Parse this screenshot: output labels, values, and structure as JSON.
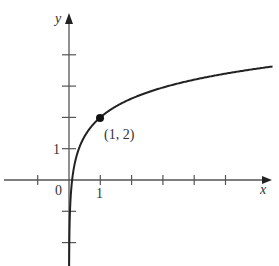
{
  "chart_data": {
    "type": "line",
    "function": "y = 2 + 2*log10(x)",
    "title": "",
    "xlabel": "x",
    "ylabel": "y",
    "x_tick_labels": [
      "0",
      "1"
    ],
    "y_tick_labels": [
      "1"
    ],
    "xlim": [
      -2.1,
      6.5
    ],
    "ylim": [
      -2.8,
      5.3
    ],
    "x_ticks": [
      -1,
      1,
      2,
      3,
      4,
      5
    ],
    "y_ticks": [
      -2,
      -1,
      1,
      2,
      3,
      4
    ],
    "grid": false,
    "highlighted_point": {
      "x": 1,
      "y": 2,
      "label": "(1, 2)"
    },
    "colors": {
      "curve": "#222222",
      "axes": "#555555"
    }
  },
  "labels": {
    "x_axis": "x",
    "y_axis": "y",
    "origin": "0",
    "x_one": "1",
    "y_one": "1",
    "point": "(1, 2)"
  }
}
